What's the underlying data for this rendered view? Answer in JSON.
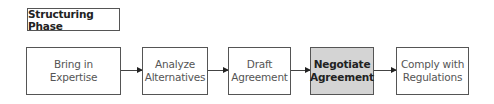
{
  "phase": {
    "title": "Structuring Phase"
  },
  "steps": [
    {
      "line1": "Bring in",
      "line2": "Expertise",
      "active": false
    },
    {
      "line1": "Analyze",
      "line2": "Alternatives",
      "active": false
    },
    {
      "line1": "Draft",
      "line2": "Agreement",
      "active": false
    },
    {
      "line1": "Negotiate",
      "line2": "Agreement",
      "active": true
    },
    {
      "line1": "Comply with",
      "line2": "Regulations",
      "active": false
    }
  ],
  "colors": {
    "active_fill": "#d4d4d4",
    "border": "#555555",
    "arrow": "#444444"
  }
}
